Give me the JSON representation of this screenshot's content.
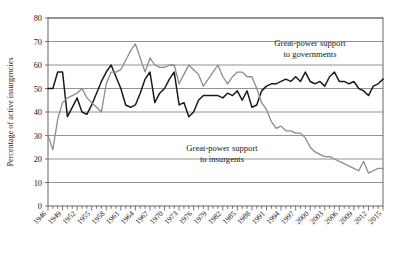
{
  "chart_data": {
    "type": "line",
    "title": "",
    "xlabel": "",
    "ylabel": "Percentage of active insurgencies",
    "ylim": [
      0,
      80
    ],
    "xlim": [
      1946,
      2015
    ],
    "ytick_values": [
      0,
      10,
      20,
      30,
      40,
      50,
      60,
      70,
      80
    ],
    "ytick_labels": [
      "0",
      "10",
      "20",
      "30",
      "40",
      "50",
      "60",
      "70",
      "80"
    ],
    "xtick_labels": [
      "1946",
      "1949",
      "1952",
      "1955",
      "1958",
      "1961",
      "1964",
      "1967",
      "1970",
      "1973",
      "1976",
      "1979",
      "1982",
      "1985",
      "1988",
      "1991",
      "1994",
      "1997",
      "2000",
      "2003",
      "2006",
      "2009",
      "2012",
      "2015"
    ],
    "xtick_label_step": 3,
    "xtick_minor_step": 1,
    "grid": "horizontal",
    "legend_position": "inline-annotation",
    "annotations": [
      {
        "name": "governments-annotation",
        "line1": "Great-power support",
        "line2": "to governments",
        "x": 310,
        "y": 46,
        "color": "#1a1a1a"
      },
      {
        "name": "insurgents-annotation",
        "line1": "Great-power support",
        "line2": "to insurgents",
        "x": 222,
        "y": 151,
        "color": "#808080"
      }
    ],
    "x": [
      1946,
      1947,
      1948,
      1949,
      1950,
      1951,
      1952,
      1953,
      1954,
      1955,
      1956,
      1957,
      1958,
      1959,
      1960,
      1961,
      1962,
      1963,
      1964,
      1965,
      1966,
      1967,
      1968,
      1969,
      1970,
      1971,
      1972,
      1973,
      1974,
      1975,
      1976,
      1977,
      1978,
      1979,
      1980,
      1981,
      1982,
      1983,
      1984,
      1985,
      1986,
      1987,
      1988,
      1989,
      1990,
      1991,
      1992,
      1993,
      1994,
      1995,
      1996,
      1997,
      1998,
      1999,
      2000,
      2001,
      2002,
      2003,
      2004,
      2005,
      2006,
      2007,
      2008,
      2009,
      2010,
      2011,
      2012,
      2013,
      2014,
      2015
    ],
    "series": [
      {
        "name": "Great-power support to governments",
        "color": "#1a1a1a",
        "width": 1.5,
        "values": [
          50,
          50,
          57,
          57,
          38,
          42,
          46,
          40,
          39,
          43,
          48,
          53,
          57,
          60,
          55,
          50,
          43,
          42,
          43,
          48,
          54,
          57,
          44,
          48,
          50,
          54,
          57,
          43,
          44,
          38,
          40,
          45,
          47,
          47,
          47,
          47,
          46,
          48,
          47,
          49,
          45,
          49,
          42,
          43,
          49,
          51,
          52,
          52,
          53,
          54,
          53,
          55,
          53,
          57,
          53,
          52,
          53,
          51,
          55,
          57,
          53,
          53,
          52,
          53,
          50,
          49,
          47,
          51,
          52,
          54
        ]
      },
      {
        "name": "Great-power support to insurgents",
        "color": "#8c8c8c",
        "width": 1.3,
        "values": [
          30,
          24,
          37,
          44,
          46,
          47,
          48,
          50,
          46,
          44,
          42,
          40,
          52,
          57,
          57,
          58,
          62,
          66,
          69,
          63,
          57,
          63,
          60,
          59,
          59,
          60,
          60,
          52,
          56,
          60,
          58,
          56,
          51,
          54,
          57,
          60,
          55,
          52,
          55,
          57,
          57,
          55,
          55,
          50,
          44,
          41,
          36,
          33,
          34,
          32,
          32,
          31,
          31,
          29,
          25,
          23,
          22,
          21,
          21,
          20,
          19,
          18,
          17,
          16,
          15,
          19,
          14,
          15,
          16,
          16
        ]
      }
    ]
  }
}
